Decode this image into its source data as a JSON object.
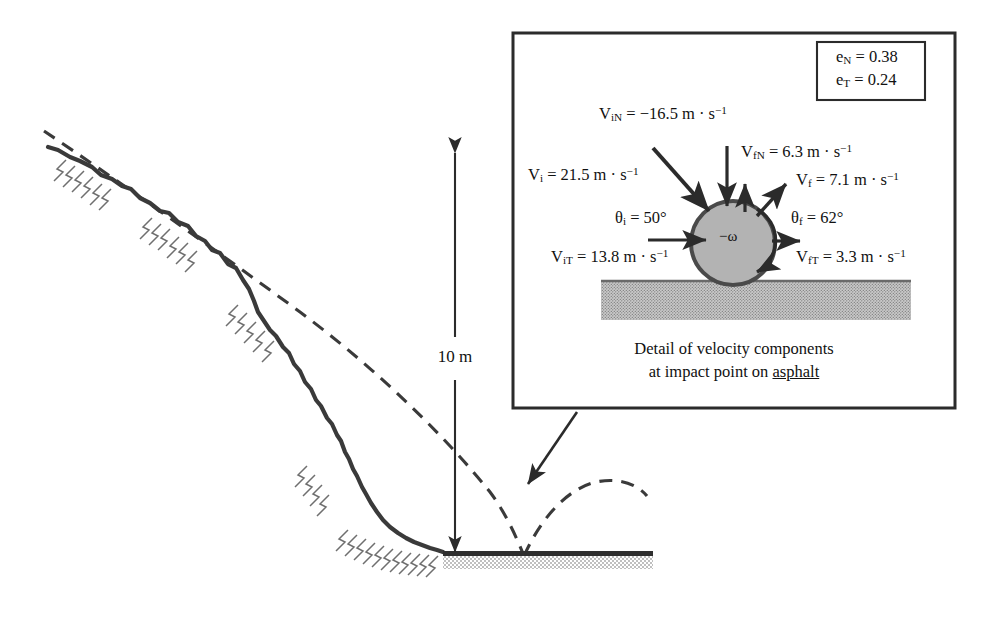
{
  "figure": {
    "type": "engineering-diagram"
  },
  "slope": {
    "dimension_label": "10 m",
    "road_material": "asphalt"
  },
  "detail_box": {
    "caption_line1": "Detail of velocity components",
    "caption_line2_pre": "at impact point on ",
    "caption_line2_underlined": "asphalt",
    "restitution": {
      "normal_label": "e",
      "normal_sub": "N",
      "normal_value": "= 0.38",
      "tangential_label": "e",
      "tangential_sub": "T",
      "tangential_value": "= 0.24"
    },
    "vectors": {
      "v_i": {
        "sym": "V",
        "sub": "i",
        "text": "= 21.5 m · s",
        "exp": "−1"
      },
      "v_iN": {
        "sym": "V",
        "sub": "iN",
        "text": "= −16.5 m · s",
        "exp": "−1"
      },
      "v_iT": {
        "sym": "V",
        "sub": "iT",
        "text": "= 13.8 m · s",
        "exp": "−1"
      },
      "v_f": {
        "sym": "V",
        "sub": "f",
        "text": "= 7.1 m · s",
        "exp": "−1"
      },
      "v_fN": {
        "sym": "V",
        "sub": "fN",
        "text": "= 6.3 m · s",
        "exp": "−1"
      },
      "v_fT": {
        "sym": "V",
        "sub": "fT",
        "text": "= 3.3 m · s",
        "exp": "−1"
      }
    },
    "angles": {
      "theta_i": {
        "sym": "θ",
        "sub": "i",
        "text": "= 50°"
      },
      "theta_f": {
        "sym": "θ",
        "sub": "f",
        "text": "= 62°"
      }
    },
    "spin": "−ω"
  },
  "colors": {
    "ink": "#2b2b2b",
    "ball_fill": "#b3b3b3",
    "ball_stroke": "#4a4a4a",
    "asphalt_fill": "#9a9a9a",
    "road_line": "#3a3a3a",
    "hatch": "#777777"
  }
}
